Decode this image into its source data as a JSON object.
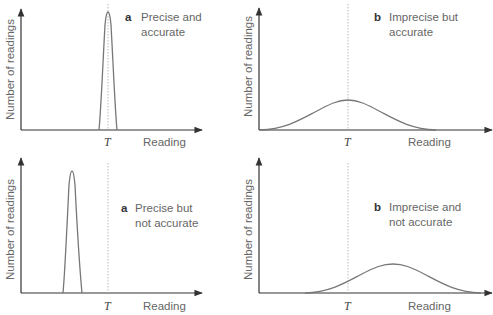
{
  "panels": [
    {
      "id": "top-left",
      "letter": "a",
      "title_line1": "Precise and",
      "title_line2": "accurate",
      "y_label": "Number of readings",
      "x_label": "Reading",
      "t_label": "T"
    },
    {
      "id": "top-right",
      "letter": "b",
      "title_line1": "Imprecise but",
      "title_line2": "accurate",
      "y_label": "Number of readings",
      "x_label": "Reading",
      "t_label": "T"
    },
    {
      "id": "bottom-left",
      "letter": "a",
      "title_line1": "Precise but",
      "title_line2": "not accurate",
      "y_label": "Number of readings",
      "x_label": "Reading",
      "t_label": "T"
    },
    {
      "id": "bottom-right",
      "letter": "b",
      "title_line1": "Imprecise and",
      "title_line2": "not accurate",
      "y_label": "Number of readings",
      "x_label": "Reading",
      "t_label": "T"
    }
  ],
  "colors": {
    "axis": "#333333",
    "curve": "#777777",
    "true_value_line": "#aaaaaa"
  }
}
